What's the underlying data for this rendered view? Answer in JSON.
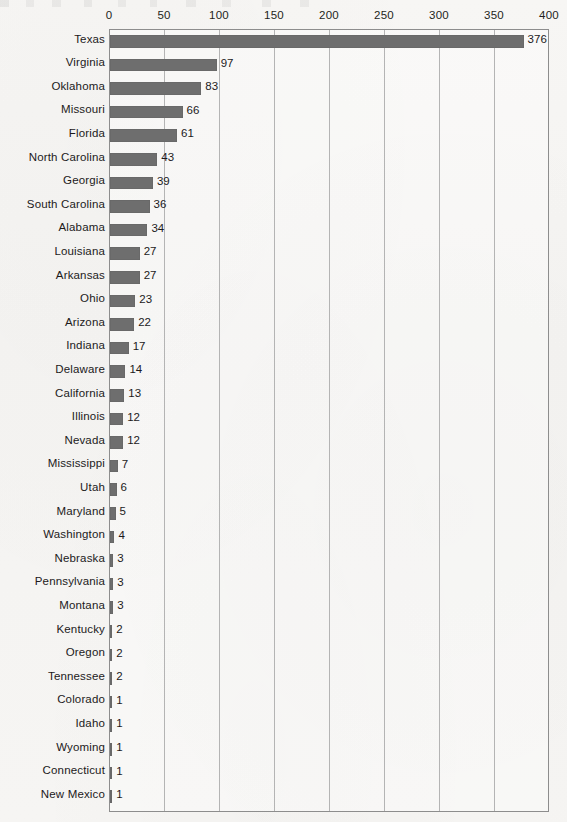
{
  "chart_data": {
    "type": "bar",
    "orientation": "horizontal",
    "title": "",
    "xlabel": "",
    "ylabel": "",
    "xlim": [
      0,
      400
    ],
    "ylim": null,
    "grid": true,
    "legend": false,
    "bar_color": "#6e6e6e",
    "axis_color": "#8d8d8d",
    "gridline_color": "#b4b4b4",
    "background_color": "#f6f5f3",
    "x_ticks": [
      0,
      50,
      100,
      150,
      200,
      250,
      300,
      350,
      400
    ],
    "x_tick_labels": [
      "0",
      "50",
      "100",
      "150",
      "200",
      "250",
      "300",
      "350",
      "400"
    ],
    "categories": [
      "Texas",
      "Virginia",
      "Oklahoma",
      "Missouri",
      "Florida",
      "North Carolina",
      "Georgia",
      "South Carolina",
      "Alabama",
      "Louisiana",
      "Arkansas",
      "Ohio",
      "Arizona",
      "Indiana",
      "Delaware",
      "California",
      "Illinois",
      "Nevada",
      "Mississippi",
      "Utah",
      "Maryland",
      "Washington",
      "Nebraska",
      "Pennsylvania",
      "Montana",
      "Kentucky",
      "Oregon",
      "Tennessee",
      "Colorado",
      "Idaho",
      "Wyoming",
      "Connecticut",
      "New Mexico"
    ],
    "values": [
      376,
      97,
      83,
      66,
      61,
      43,
      39,
      36,
      34,
      27,
      27,
      23,
      22,
      17,
      14,
      13,
      12,
      12,
      7,
      6,
      5,
      4,
      3,
      3,
      3,
      2,
      2,
      2,
      1,
      1,
      1,
      1,
      1
    ],
    "data_labels": [
      "376",
      "97",
      "83",
      "66",
      "61",
      "43",
      "39",
      "36",
      "34",
      "27",
      "27",
      "23",
      "22",
      "17",
      "14",
      "13",
      "12",
      "12",
      "7",
      "6",
      "5",
      "4",
      "3",
      "3",
      "3",
      "2",
      "2",
      "2",
      "1",
      "1",
      "1",
      "1",
      "1"
    ]
  }
}
